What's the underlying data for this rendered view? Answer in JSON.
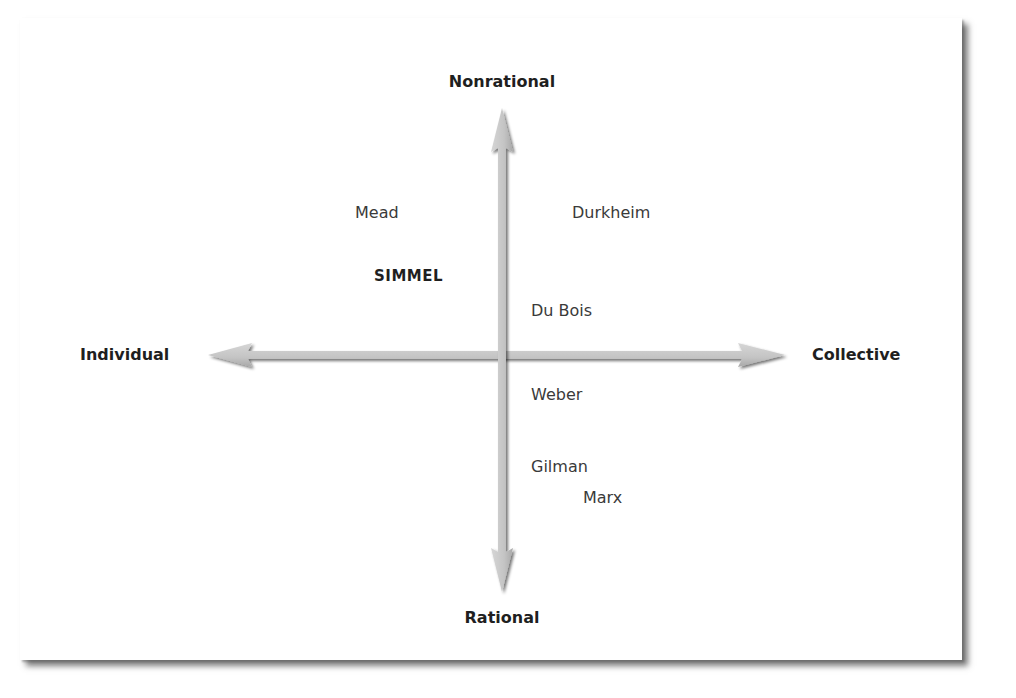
{
  "diagram": {
    "type": "quadrant",
    "axes": {
      "vertical": {
        "top": "Nonrational",
        "bottom": "Rational"
      },
      "horizontal": {
        "left": "Individual",
        "right": "Collective"
      }
    },
    "theorists": [
      {
        "name": "Mead",
        "emphasis": false
      },
      {
        "name": "Durkheim",
        "emphasis": false
      },
      {
        "name": "SIMMEL",
        "emphasis": true
      },
      {
        "name": "Du Bois",
        "emphasis": false
      },
      {
        "name": "Weber",
        "emphasis": false
      },
      {
        "name": "Gilman",
        "emphasis": false
      },
      {
        "name": "Marx",
        "emphasis": false
      }
    ],
    "colors": {
      "arrow_fill": "#c8c8c8",
      "arrow_shadow": "#8a8a8a",
      "text": "#2a2a2a",
      "card_shadow": "#808080"
    }
  }
}
